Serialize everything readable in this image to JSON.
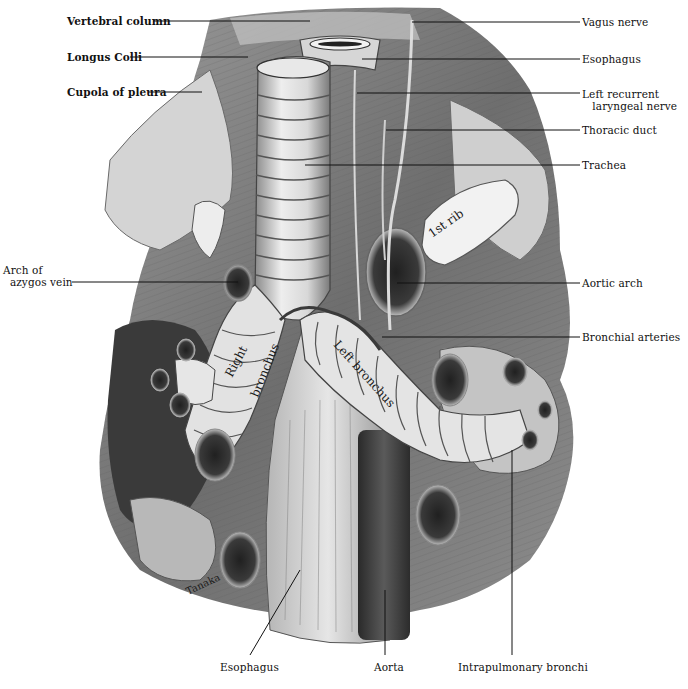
{
  "figure": {
    "signature": "Tanaka"
  },
  "labels_left": [
    {
      "id": "vertebral-column",
      "text": "Vertebral column",
      "bold": true
    },
    {
      "id": "longus-colli",
      "text": "Longus Colli",
      "bold": true
    },
    {
      "id": "cupola-of-pleura",
      "text": "Cupola of pleura",
      "bold": true
    },
    {
      "id": "arch-of-azygos-vein",
      "text": "Arch of\n  azygos vein",
      "bold": false
    }
  ],
  "labels_right": [
    {
      "id": "vagus-nerve",
      "text": "Vagus nerve"
    },
    {
      "id": "esophagus-top",
      "text": "Esophagus"
    },
    {
      "id": "left-recurrent-laryngeal-nerve",
      "text": "Left recurrent\n   laryngeal nerve"
    },
    {
      "id": "thoracic-duct",
      "text": "Thoracic duct"
    },
    {
      "id": "trachea",
      "text": "Trachea"
    },
    {
      "id": "aortic-arch",
      "text": "Aortic arch"
    },
    {
      "id": "bronchial-arteries",
      "text": "Bronchial arteries"
    }
  ],
  "labels_bottom": [
    {
      "id": "esophagus-bottom",
      "text": "Esophagus"
    },
    {
      "id": "aorta",
      "text": "Aorta"
    },
    {
      "id": "intrapulmonary-bronchi",
      "text": "Intrapulmonary bronchi"
    }
  ],
  "inline_labels": {
    "first_rib": "1st rib",
    "right_bronchus_1": "Right",
    "right_bronchus_2": "bronchus",
    "left_bronchus": "Left bronchus"
  }
}
